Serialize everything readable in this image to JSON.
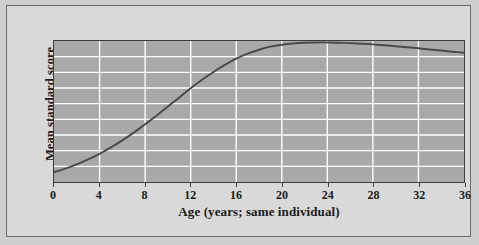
{
  "figure": {
    "background_color": "#d9d9d9",
    "frame_border_color": "#6b6b6b",
    "page_background_color": "#cfcfcf"
  },
  "chart_data": {
    "type": "line",
    "title": "",
    "xlabel": "Age (years; same individual)",
    "ylabel": "Mean standard score",
    "xlim": [
      0,
      36
    ],
    "ylim": [
      0,
      100
    ],
    "xticks": [
      0,
      4,
      8,
      12,
      16,
      20,
      24,
      28,
      32,
      36
    ],
    "xtick_labels": [
      "0",
      "4",
      "8",
      "12",
      "16",
      "20",
      "24",
      "28",
      "32",
      "36"
    ],
    "yticks": [],
    "ytick_labels": [],
    "grid": true,
    "grid_color": "#ffffff",
    "grid_horizontal_lines": 8,
    "grid_vertical_lines": 8,
    "plot_background_color": "#a9a9a9",
    "plot_border_color": "#3c3c3c",
    "legend": false,
    "series": [
      {
        "name": "Mean standard score",
        "color": "#4a4a4a",
        "line_width": 2,
        "x": [
          0,
          1,
          2,
          3,
          4,
          5,
          6,
          7,
          8,
          9,
          10,
          11,
          12,
          13,
          14,
          15,
          16,
          17,
          18,
          19,
          20,
          21,
          22,
          23,
          24,
          25,
          26,
          27,
          28,
          29,
          30,
          31,
          32,
          33,
          34,
          35,
          36
        ],
        "y": [
          7,
          9.5,
          12.5,
          16,
          20,
          24.5,
          29.5,
          35,
          41,
          47,
          53.5,
          60,
          66.5,
          72.5,
          78,
          83,
          87.5,
          91,
          93.8,
          96,
          97.4,
          98.3,
          98.8,
          99,
          99,
          98.8,
          98.5,
          98.1,
          97.6,
          97,
          96.3,
          95.6,
          94.8,
          94,
          93.2,
          92.4,
          91.6
        ]
      }
    ]
  },
  "axis": {
    "x_title": "Age (years; same individual)",
    "y_title": "Mean standard score"
  }
}
